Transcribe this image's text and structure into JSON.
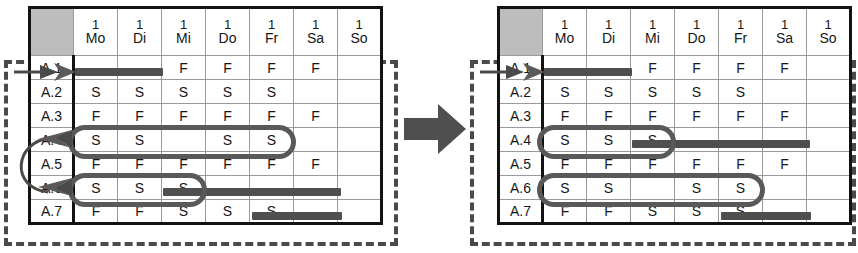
{
  "figure": {
    "type": "before-after-swap-diagram",
    "caption_absent": true,
    "transition_icon": "right-arrow-icon",
    "accent_color": "#4f4f4f",
    "header_bg": "#b6b6b6",
    "grid_line_color": "#9a9a9a",
    "frame_color": "#4a4a4a"
  },
  "columns": {
    "corner_label": "",
    "days": [
      {
        "num": "1",
        "abbr": "Mo"
      },
      {
        "num": "1",
        "abbr": "Di"
      },
      {
        "num": "1",
        "abbr": "Mi"
      },
      {
        "num": "1",
        "abbr": "Do"
      },
      {
        "num": "1",
        "abbr": "Fr"
      },
      {
        "num": "1",
        "abbr": "Sa"
      },
      {
        "num": "1",
        "abbr": "So"
      }
    ]
  },
  "left_table": {
    "name": "before-state",
    "rows": [
      {
        "label": "A.1",
        "label_obscured": true,
        "cells": [
          "",
          "",
          "F",
          "F",
          "F",
          "F",
          ""
        ]
      },
      {
        "label": "A.2",
        "label_obscured": false,
        "cells": [
          "S",
          "S",
          "S",
          "S",
          "S",
          "",
          ""
        ]
      },
      {
        "label": "A.3",
        "label_obscured": false,
        "cells": [
          "F",
          "F",
          "F",
          "F",
          "F",
          "F",
          ""
        ]
      },
      {
        "label": "A.4",
        "label_obscured": true,
        "cells": [
          "S",
          "S",
          "",
          "S",
          "S",
          "",
          ""
        ]
      },
      {
        "label": "A.5",
        "label_obscured": false,
        "cells": [
          "F",
          "F",
          "F",
          "F",
          "F",
          "F",
          ""
        ]
      },
      {
        "label": "A.6",
        "label_obscured": true,
        "cells": [
          "S",
          "S",
          "S",
          "",
          "",
          "",
          ""
        ]
      },
      {
        "label": "A.7",
        "label_obscured": false,
        "cells": [
          "F",
          "F",
          "S",
          "S",
          "S",
          "",
          ""
        ]
      }
    ],
    "bars": [
      {
        "row": "A.1",
        "start_col": "Mo",
        "span_cols": 2
      },
      {
        "row": "A.6",
        "start_col": "Do",
        "span_cols": 4
      },
      {
        "row": "A.7",
        "start_col": "Sa",
        "span_cols": 2
      }
    ],
    "highlights": [
      {
        "row": "A.4",
        "start_col": "Mo",
        "span_cols": 5
      },
      {
        "row": "A.6",
        "start_col": "Mo",
        "span_cols": 3
      }
    ],
    "pointers": [
      {
        "target_row": "A.1",
        "kind": "pointer-arrow-icon"
      },
      {
        "target_row": "A.4",
        "kind": "swap-arrow-icon"
      },
      {
        "target_row": "A.6",
        "kind": "swap-arrow-icon"
      }
    ]
  },
  "right_table": {
    "name": "after-state",
    "rows": [
      {
        "label": "A.1",
        "label_obscured": true,
        "cells": [
          "",
          "",
          "F",
          "F",
          "F",
          "F",
          ""
        ]
      },
      {
        "label": "A.2",
        "label_obscured": false,
        "cells": [
          "S",
          "S",
          "S",
          "S",
          "S",
          "",
          ""
        ]
      },
      {
        "label": "A.3",
        "label_obscured": false,
        "cells": [
          "F",
          "F",
          "F",
          "F",
          "F",
          "F",
          ""
        ]
      },
      {
        "label": "A.4",
        "label_obscured": false,
        "cells": [
          "S",
          "S",
          "S",
          "",
          "",
          "",
          ""
        ]
      },
      {
        "label": "A.5",
        "label_obscured": false,
        "cells": [
          "F",
          "F",
          "F",
          "F",
          "F",
          "F",
          ""
        ]
      },
      {
        "label": "A.6",
        "label_obscured": false,
        "cells": [
          "S",
          "S",
          "",
          "S",
          "S",
          "",
          ""
        ]
      },
      {
        "label": "A.7",
        "label_obscured": false,
        "cells": [
          "F",
          "F",
          "S",
          "S",
          "S",
          "",
          ""
        ]
      }
    ],
    "bars": [
      {
        "row": "A.1",
        "start_col": "Mo",
        "span_cols": 2
      },
      {
        "row": "A.4",
        "start_col": "Do",
        "span_cols": 4
      },
      {
        "row": "A.7",
        "start_col": "Sa",
        "span_cols": 2
      }
    ],
    "highlights": [
      {
        "row": "A.4",
        "start_col": "Mo",
        "span_cols": 3
      },
      {
        "row": "A.6",
        "start_col": "Mo",
        "span_cols": 5
      }
    ],
    "pointers": [
      {
        "target_row": "A.1",
        "kind": "pointer-arrow-icon"
      }
    ]
  }
}
